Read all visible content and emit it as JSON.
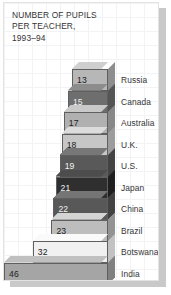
{
  "title": "NUMBER OF PUPILS\nPER TEACHER,\n1993–94",
  "chart_data": {
    "type": "bar",
    "orientation": "horizontal",
    "title": "NUMBER OF PUPILS PER TEACHER, 1993–94",
    "xlabel": "",
    "ylabel": "",
    "grid": true,
    "legend": "none",
    "note": "3-D horizontal bars anchored at a common right edge, extending leftward as the value grows",
    "categories": [
      "Russia",
      "Canada",
      "Australia",
      "U.K.",
      "U.S.",
      "Japan",
      "China",
      "Brazil",
      "Botswana",
      "India"
    ],
    "values": [
      13,
      15,
      17,
      18,
      19,
      21,
      22,
      23,
      32,
      46
    ],
    "xlim": [
      0,
      46
    ],
    "series": [
      {
        "name": "Pupils per teacher",
        "values": [
          13,
          15,
          17,
          18,
          19,
          21,
          22,
          23,
          32,
          46
        ]
      }
    ],
    "bars": [
      {
        "label": "Russia",
        "value": 13,
        "value_text": "13",
        "fill": "#b7b7b7",
        "top": "#cfcfcf",
        "side": "#8e8e8e",
        "dark_text": false
      },
      {
        "label": "Canada",
        "value": 15,
        "value_text": "15",
        "fill": "#6e6e6e",
        "top": "#8c8c8c",
        "side": "#555555",
        "dark_text": true
      },
      {
        "label": "Australia",
        "value": 17,
        "value_text": "17",
        "fill": "#b0b0b0",
        "top": "#c9c9c9",
        "side": "#888888",
        "dark_text": false
      },
      {
        "label": "U.K.",
        "value": 18,
        "value_text": "18",
        "fill": "#c6c6c6",
        "top": "#dcdcdc",
        "side": "#9c9c9c",
        "dark_text": false
      },
      {
        "label": "U.S.",
        "value": 19,
        "value_text": "19",
        "fill": "#595959",
        "top": "#777777",
        "side": "#434343",
        "dark_text": true
      },
      {
        "label": "Japan",
        "value": 21,
        "value_text": "21",
        "fill": "#2f2f2f",
        "top": "#4d4d4d",
        "side": "#1e1e1e",
        "dark_text": true
      },
      {
        "label": "China",
        "value": 22,
        "value_text": "22",
        "fill": "#585858",
        "top": "#757575",
        "side": "#424242",
        "dark_text": true
      },
      {
        "label": "Brazil",
        "value": 23,
        "value_text": "23",
        "fill": "#bdbdbd",
        "top": "#d4d4d4",
        "side": "#939393",
        "dark_text": false
      },
      {
        "label": "Botswana",
        "value": 32,
        "value_text": "32",
        "fill": "#f1f1f1",
        "top": "#fafafa",
        "side": "#c2c2c2",
        "dark_text": false
      },
      {
        "label": "India",
        "value": 46,
        "value_text": "46",
        "fill": "#a5a5a5",
        "top": "#c0c0c0",
        "side": "#808080",
        "dark_text": false
      }
    ],
    "colors": {
      "background": "#ffffff",
      "grid_line": "#eff1f3",
      "text": "#343434",
      "shadow": "#c9c9c9"
    }
  }
}
